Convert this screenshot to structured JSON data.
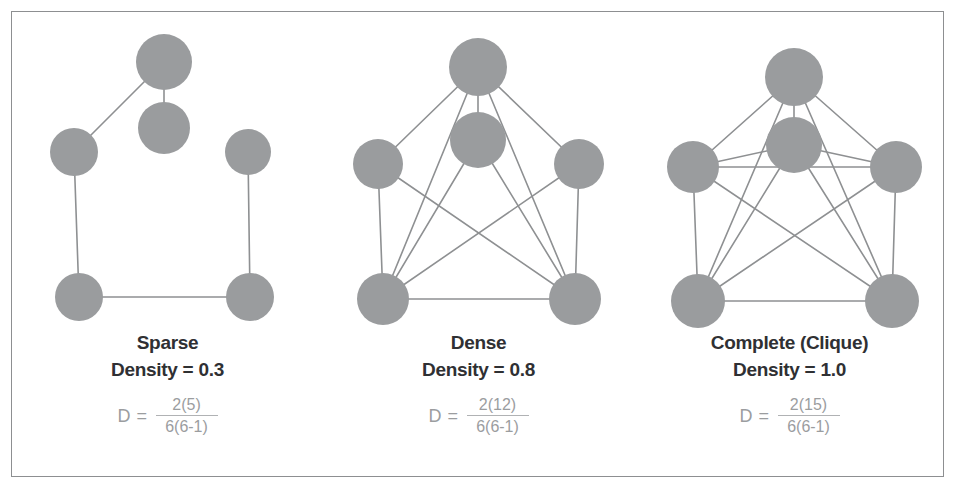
{
  "figure": {
    "background_color": "#ffffff",
    "border_color": "#8d8f91",
    "node_color": "#9a9c9e",
    "edge_color": "#8e9092",
    "caption_color": "#2f3033",
    "formula_color": "#9b9d9f"
  },
  "panels": [
    {
      "id": "sparse",
      "title": "Sparse",
      "density_label": "Density = 0.3",
      "formula": {
        "lhs": "D =",
        "numerator": "2(5)",
        "denominator": "6(6-1)"
      },
      "graph": {
        "node_count": 6,
        "edge_count": 5,
        "nodes": [
          {
            "id": "top",
            "cx": 152,
            "cy": 50,
            "r": 28
          },
          {
            "id": "center",
            "cx": 152,
            "cy": 116,
            "r": 26
          },
          {
            "id": "left",
            "cx": 62,
            "cy": 140,
            "r": 24
          },
          {
            "id": "right",
            "cx": 236,
            "cy": 140,
            "r": 23
          },
          {
            "id": "bottom-left",
            "cx": 67,
            "cy": 285,
            "r": 24
          },
          {
            "id": "bottom-right",
            "cx": 238,
            "cy": 285,
            "r": 24
          }
        ],
        "edges": [
          [
            "top",
            "center"
          ],
          [
            "top",
            "left"
          ],
          [
            "left",
            "bottom-left"
          ],
          [
            "bottom-left",
            "bottom-right"
          ],
          [
            "bottom-right",
            "right"
          ]
        ]
      }
    },
    {
      "id": "dense",
      "title": "Dense",
      "density_label": "Density = 0.8",
      "formula": {
        "lhs": "D =",
        "numerator": "2(12)",
        "denominator": "6(6-1)"
      },
      "graph": {
        "node_count": 6,
        "edge_count": 12,
        "nodes": [
          {
            "id": "top",
            "cx": 155,
            "cy": 55,
            "r": 29
          },
          {
            "id": "center",
            "cx": 155,
            "cy": 128,
            "r": 28
          },
          {
            "id": "left",
            "cx": 55,
            "cy": 152,
            "r": 25
          },
          {
            "id": "right",
            "cx": 256,
            "cy": 152,
            "r": 25
          },
          {
            "id": "bottom-left",
            "cx": 60,
            "cy": 287,
            "r": 26
          },
          {
            "id": "bottom-right",
            "cx": 252,
            "cy": 287,
            "r": 26
          }
        ],
        "edges": [
          [
            "top",
            "center"
          ],
          [
            "top",
            "left"
          ],
          [
            "top",
            "right"
          ],
          [
            "top",
            "bottom-left"
          ],
          [
            "top",
            "bottom-right"
          ],
          [
            "center",
            "bottom-left"
          ],
          [
            "center",
            "bottom-right"
          ],
          [
            "left",
            "bottom-left"
          ],
          [
            "left",
            "bottom-right"
          ],
          [
            "right",
            "bottom-right"
          ],
          [
            "right",
            "bottom-left"
          ],
          [
            "bottom-left",
            "bottom-right"
          ]
        ]
      }
    },
    {
      "id": "complete",
      "title": "Complete (Clique)",
      "density_label": "Density = 1.0",
      "formula": {
        "lhs": "D =",
        "numerator": "2(15)",
        "denominator": "6(6-1)"
      },
      "graph": {
        "node_count": 6,
        "edge_count": 15,
        "nodes": [
          {
            "id": "top",
            "cx": 160,
            "cy": 65,
            "r": 29
          },
          {
            "id": "center",
            "cx": 160,
            "cy": 133,
            "r": 28
          },
          {
            "id": "left",
            "cx": 59,
            "cy": 155,
            "r": 26
          },
          {
            "id": "right",
            "cx": 262,
            "cy": 155,
            "r": 26
          },
          {
            "id": "bottom-left",
            "cx": 64,
            "cy": 289,
            "r": 27
          },
          {
            "id": "bottom-right",
            "cx": 258,
            "cy": 289,
            "r": 27
          }
        ],
        "edges": [
          [
            "top",
            "center"
          ],
          [
            "top",
            "left"
          ],
          [
            "top",
            "right"
          ],
          [
            "top",
            "bottom-left"
          ],
          [
            "top",
            "bottom-right"
          ],
          [
            "center",
            "left"
          ],
          [
            "center",
            "right"
          ],
          [
            "center",
            "bottom-left"
          ],
          [
            "center",
            "bottom-right"
          ],
          [
            "left",
            "right"
          ],
          [
            "left",
            "bottom-left"
          ],
          [
            "left",
            "bottom-right"
          ],
          [
            "right",
            "bottom-left"
          ],
          [
            "right",
            "bottom-right"
          ],
          [
            "bottom-left",
            "bottom-right"
          ]
        ]
      }
    }
  ]
}
